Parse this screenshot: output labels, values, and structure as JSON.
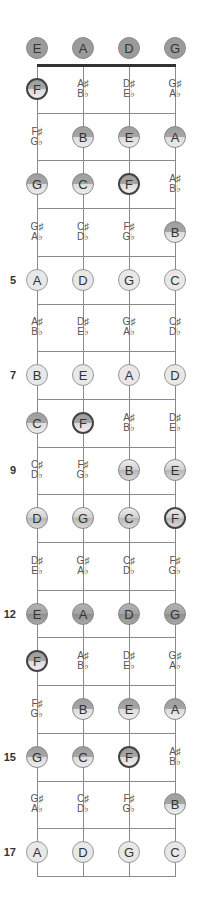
{
  "diagram": {
    "type": "fretboard",
    "strings": [
      "E",
      "A",
      "D",
      "G"
    ],
    "open_notes": [
      "E",
      "A",
      "D",
      "G"
    ],
    "fret_markers": [
      5,
      7,
      9,
      12,
      15,
      17
    ],
    "num_frets": 17,
    "rows": [
      {
        "fret": 1,
        "cells": [
          {
            "n": "F",
            "style": "half",
            "f": true
          },
          {
            "sharp": "A♯",
            "flat": "B♭"
          },
          {
            "sharp": "D♯",
            "flat": "E♭"
          },
          {
            "sharp": "G♯",
            "flat": "A♭"
          }
        ]
      },
      {
        "fret": 2,
        "cells": [
          {
            "sharp": "F♯",
            "flat": "G♭"
          },
          {
            "n": "B",
            "style": "half"
          },
          {
            "n": "E",
            "style": "half"
          },
          {
            "n": "A",
            "style": "half"
          }
        ]
      },
      {
        "fret": 3,
        "cells": [
          {
            "n": "G",
            "style": "half"
          },
          {
            "n": "C",
            "style": "half"
          },
          {
            "n": "F",
            "style": "half",
            "f": true
          },
          {
            "sharp": "A♯",
            "flat": "B♭"
          }
        ]
      },
      {
        "fret": 4,
        "cells": [
          {
            "sharp": "G♯",
            "flat": "A♭"
          },
          {
            "sharp": "C♯",
            "flat": "D♭"
          },
          {
            "sharp": "F♯",
            "flat": "G♭"
          },
          {
            "n": "B",
            "style": "half"
          }
        ]
      },
      {
        "fret": 5,
        "cells": [
          {
            "n": "A",
            "style": "light"
          },
          {
            "n": "D",
            "style": "light"
          },
          {
            "n": "G",
            "style": "light"
          },
          {
            "n": "C",
            "style": "light"
          }
        ]
      },
      {
        "fret": 6,
        "cells": [
          {
            "sharp": "A♯",
            "flat": "B♭"
          },
          {
            "sharp": "D♯",
            "flat": "E♭"
          },
          {
            "sharp": "G♯",
            "flat": "A♭"
          },
          {
            "sharp": "C♯",
            "flat": "D♭"
          }
        ]
      },
      {
        "fret": 7,
        "cells": [
          {
            "n": "B",
            "style": "light"
          },
          {
            "n": "E",
            "style": "light"
          },
          {
            "n": "A",
            "style": "light"
          },
          {
            "n": "D",
            "style": "light"
          }
        ]
      },
      {
        "fret": 8,
        "cells": [
          {
            "n": "C",
            "style": "half"
          },
          {
            "n": "F",
            "style": "half",
            "f": true
          },
          {
            "sharp": "A♯",
            "flat": "B♭"
          },
          {
            "sharp": "D♯",
            "flat": "E♭"
          }
        ]
      },
      {
        "fret": 9,
        "cells": [
          {
            "sharp": "C♯",
            "flat": "D♭"
          },
          {
            "sharp": "F♯",
            "flat": "G♭"
          },
          {
            "n": "B",
            "style": "metal"
          },
          {
            "n": "E",
            "style": "metal"
          }
        ]
      },
      {
        "fret": 10,
        "cells": [
          {
            "n": "D",
            "style": "metal"
          },
          {
            "n": "G",
            "style": "metal"
          },
          {
            "n": "C",
            "style": "metal"
          },
          {
            "n": "F",
            "style": "metal",
            "f": true
          }
        ]
      },
      {
        "fret": 11,
        "cells": [
          {
            "sharp": "D♯",
            "flat": "E♭"
          },
          {
            "sharp": "G♯",
            "flat": "A♭"
          },
          {
            "sharp": "C♯",
            "flat": "D♭"
          },
          {
            "sharp": "F♯",
            "flat": "G♭"
          }
        ]
      },
      {
        "fret": 12,
        "cells": [
          {
            "n": "E",
            "style": "dark"
          },
          {
            "n": "A",
            "style": "dark"
          },
          {
            "n": "D",
            "style": "dark"
          },
          {
            "n": "G",
            "style": "dark"
          }
        ]
      },
      {
        "fret": 13,
        "cells": [
          {
            "n": "F",
            "style": "half",
            "f": true
          },
          {
            "sharp": "A♯",
            "flat": "B♭"
          },
          {
            "sharp": "D♯",
            "flat": "E♭"
          },
          {
            "sharp": "G♯",
            "flat": "A♭"
          }
        ]
      },
      {
        "fret": 14,
        "cells": [
          {
            "sharp": "F♯",
            "flat": "G♭"
          },
          {
            "n": "B",
            "style": "half"
          },
          {
            "n": "E",
            "style": "half"
          },
          {
            "n": "A",
            "style": "half"
          }
        ]
      },
      {
        "fret": 15,
        "cells": [
          {
            "n": "G",
            "style": "half"
          },
          {
            "n": "C",
            "style": "half"
          },
          {
            "n": "F",
            "style": "half",
            "f": true
          },
          {
            "sharp": "A♯",
            "flat": "B♭"
          }
        ]
      },
      {
        "fret": 16,
        "cells": [
          {
            "sharp": "G♯",
            "flat": "A♭"
          },
          {
            "sharp": "C♯",
            "flat": "D♭"
          },
          {
            "sharp": "F♯",
            "flat": "G♭"
          },
          {
            "n": "B",
            "style": "half"
          }
        ]
      },
      {
        "fret": 17,
        "cells": [
          {
            "n": "A",
            "style": "light"
          },
          {
            "n": "D",
            "style": "light"
          },
          {
            "n": "G",
            "style": "light"
          },
          {
            "n": "C",
            "style": "light"
          }
        ]
      }
    ]
  }
}
